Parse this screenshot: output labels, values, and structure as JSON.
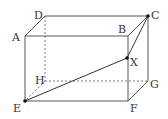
{
  "diagram": {
    "type": "rectangular-prism",
    "vertices": {
      "A": {
        "label": "A",
        "x": 25,
        "y": 36
      },
      "B": {
        "label": "B",
        "x": 128,
        "y": 36
      },
      "C": {
        "label": "C",
        "x": 148,
        "y": 16
      },
      "D": {
        "label": "D",
        "x": 45,
        "y": 16
      },
      "E": {
        "label": "E",
        "x": 25,
        "y": 101
      },
      "F": {
        "label": "F",
        "x": 128,
        "y": 101
      },
      "G": {
        "label": "G",
        "x": 148,
        "y": 81
      },
      "H": {
        "label": "H",
        "x": 45,
        "y": 81
      },
      "X": {
        "label": "X",
        "x": 127,
        "y": 58
      }
    },
    "labels": {
      "A": "A",
      "B": "B",
      "C": "C",
      "D": "D",
      "E": "E",
      "F": "F",
      "G": "G",
      "H": "H",
      "X": "X"
    },
    "solid_edges": [
      "AB",
      "BC",
      "CD",
      "DA",
      "AE",
      "BF",
      "CG",
      "EF",
      "FG"
    ],
    "hidden_edges": [
      "DH",
      "HE",
      "HG"
    ],
    "highlighted_segments": [
      "EX",
      "XC"
    ],
    "points": [
      "E",
      "X",
      "C"
    ],
    "colors": {
      "line": "#444444",
      "point": "#111111",
      "text": "#333333"
    }
  }
}
